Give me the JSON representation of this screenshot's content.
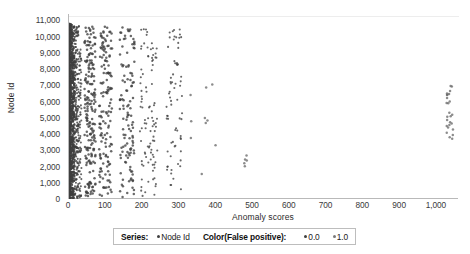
{
  "chart_data": {
    "type": "scatter",
    "title": "",
    "xlabel": "Anomaly scores",
    "ylabel": "Node Id",
    "xlim": [
      0,
      1060
    ],
    "ylim": [
      0,
      11400
    ],
    "xticks": [
      "0",
      "100",
      "200",
      "300",
      "400",
      "500",
      "600",
      "700",
      "800",
      "900",
      "1,000"
    ],
    "xtick_values": [
      0,
      100,
      200,
      300,
      400,
      500,
      600,
      700,
      800,
      900,
      1000
    ],
    "yticks": [
      "0",
      "1,000",
      "2,000",
      "3,000",
      "4,000",
      "5,000",
      "6,000",
      "7,000",
      "8,000",
      "9,000",
      "10,000",
      "11,000"
    ],
    "ytick_values": [
      0,
      1000,
      2000,
      3000,
      4000,
      5000,
      6000,
      7000,
      8000,
      9000,
      10000,
      11000
    ],
    "grid": false,
    "legend_position": "bottom",
    "marker_color": "#404040",
    "marker_size": 2,
    "series": [
      {
        "name": "Node Id",
        "color_field": "False positive",
        "color_levels": [
          "0.0",
          "1.0"
        ],
        "level_colors": [
          "#3f3f3f",
          "#6b6b6b"
        ],
        "clusters": [
          {
            "note": "dense vertical band of near-zero anomaly scores across all node ids",
            "x_range": [
              0,
              14
            ],
            "y_range": [
              0,
              10800
            ],
            "count": 1400,
            "level": "0.0",
            "density": "solid"
          },
          {
            "note": "secondary band",
            "x_range": [
              14,
              34
            ],
            "y_range": [
              0,
              10700
            ],
            "count": 320,
            "level": "0.0",
            "density": "heavy"
          },
          {
            "note": "scattered column near 45-70",
            "x_range": [
              42,
              72
            ],
            "y_range": [
              150,
              10700
            ],
            "count": 200,
            "level": "0.0",
            "density": "medium"
          },
          {
            "note": "column near 85-115",
            "x_range": [
              82,
              118
            ],
            "y_range": [
              100,
              10750
            ],
            "count": 150,
            "level": "0.0",
            "density": "medium"
          },
          {
            "note": "column near 140-175",
            "x_range": [
              138,
              178
            ],
            "y_range": [
              120,
              10700
            ],
            "count": 120,
            "level": "0.0",
            "density": "medium"
          },
          {
            "note": "column near 195-235",
            "x_range": [
              192,
              240
            ],
            "y_range": [
              150,
              10600
            ],
            "count": 95,
            "level": "0.0",
            "density": "light"
          },
          {
            "note": "column near 270-305",
            "x_range": [
              265,
              308
            ],
            "y_range": [
              200,
              10500
            ],
            "count": 70,
            "level": "0.0",
            "density": "light"
          },
          {
            "note": "sparse outliers 320-410",
            "x_range": [
              318,
              410
            ],
            "y_range": [
              1500,
              7600
            ],
            "count": 10,
            "level": "1.0",
            "density": "sparse"
          },
          {
            "note": "small vertical cluster near 480",
            "x_range": [
              476,
              486
            ],
            "y_range": [
              1900,
              2700
            ],
            "count": 5,
            "level": "1.0",
            "density": "sparse"
          },
          {
            "note": "far right cluster near 1030-1042",
            "x_range": [
              1026,
              1044
            ],
            "y_range": [
              3700,
              7100
            ],
            "count": 26,
            "level": "1.0",
            "density": "medium"
          }
        ]
      }
    ]
  },
  "legend": {
    "series_label": "Series:",
    "series_value": "Node Id",
    "color_label": "Color(False positive):",
    "color_values": [
      "0.0",
      "1.0"
    ],
    "dot_colors": [
      "#3f3f3f",
      "#7a7a7a"
    ]
  }
}
